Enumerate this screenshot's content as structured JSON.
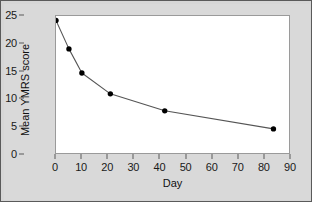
{
  "chart_data": {
    "type": "line",
    "title": "",
    "xlabel": "Day",
    "ylabel": "Mean YMRS score",
    "x": [
      0,
      5,
      10,
      21,
      42,
      84
    ],
    "values": [
      24.2,
      19.0,
      14.6,
      10.8,
      7.7,
      4.4
    ],
    "series": [
      {
        "name": "Mean YMRS score",
        "x": [
          0,
          5,
          10,
          21,
          42,
          84
        ],
        "values": [
          24.2,
          19.0,
          14.6,
          10.8,
          7.7,
          4.4
        ]
      }
    ],
    "xlim": [
      0,
      90
    ],
    "ylim": [
      0,
      25
    ],
    "xticks": [
      0,
      10,
      20,
      30,
      40,
      50,
      60,
      70,
      80,
      90
    ],
    "yticks": [
      0,
      5,
      10,
      15,
      20,
      25
    ],
    "xtick_labels": [
      "0",
      "10",
      "20",
      "30",
      "40",
      "50",
      "60",
      "70",
      "80",
      "90"
    ],
    "ytick_labels": [
      "0",
      "5",
      "10",
      "15",
      "20",
      "25"
    ],
    "grid": false,
    "legend": false,
    "marker": "filled-circle",
    "line_color": "#555555",
    "marker_color": "#000000",
    "plot_background": "#ffffff",
    "figure_background": "#d9d9d9",
    "border_color": "#5a5a5a"
  }
}
